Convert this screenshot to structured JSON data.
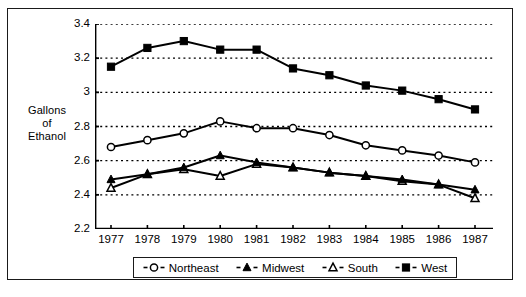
{
  "figure": {
    "background": "#ffffff",
    "border_color": "#1a1a1a"
  },
  "axis_title": {
    "line1": "Gallons",
    "line2": "of",
    "line3": "Ethanol"
  },
  "y_axis": {
    "ticks": [
      "3.4",
      "3.2",
      "3",
      "2.8",
      "2.6",
      "2.4",
      "2.2"
    ],
    "min": 2.2,
    "max": 3.4,
    "gridlines": true
  },
  "x_axis": {
    "ticks": [
      "1977",
      "1978",
      "1979",
      "1980",
      "1981",
      "1982",
      "1983",
      "1984",
      "1985",
      "1986",
      "1987"
    ]
  },
  "legend": {
    "items": [
      {
        "label": "Northeast",
        "marker": "open-circle-icon"
      },
      {
        "label": "Midwest",
        "marker": "filled-triangle-icon"
      },
      {
        "label": "South",
        "marker": "open-triangle-icon"
      },
      {
        "label": "West",
        "marker": "filled-square-icon"
      }
    ]
  },
  "chart_data": {
    "type": "line",
    "title": "",
    "xlabel": "",
    "ylabel": "Gallons of Ethanol",
    "x": [
      "1977",
      "1978",
      "1979",
      "1980",
      "1981",
      "1982",
      "1983",
      "1984",
      "1985",
      "1986",
      "1987"
    ],
    "ylim": [
      2.2,
      3.4
    ],
    "yticks": [
      2.2,
      2.4,
      2.6,
      2.8,
      3.0,
      3.2,
      3.4
    ],
    "grid": "horizontal-dotted",
    "legend_position": "bottom",
    "series": [
      {
        "name": "Northeast",
        "marker": "open-circle",
        "color": "#000000",
        "values": [
          2.68,
          2.72,
          2.76,
          2.83,
          2.79,
          2.79,
          2.75,
          2.69,
          2.66,
          2.63,
          2.59
        ]
      },
      {
        "name": "Midwest",
        "marker": "filled-triangle",
        "color": "#000000",
        "values": [
          2.49,
          2.52,
          2.56,
          2.63,
          2.59,
          2.56,
          2.53,
          2.51,
          2.49,
          2.46,
          2.43
        ]
      },
      {
        "name": "South",
        "marker": "open-triangle",
        "color": "#000000",
        "values": [
          2.44,
          2.52,
          2.55,
          2.51,
          2.58,
          2.56,
          2.53,
          2.51,
          2.48,
          2.46,
          2.38
        ]
      },
      {
        "name": "West",
        "marker": "filled-square",
        "color": "#000000",
        "values": [
          3.15,
          3.26,
          3.3,
          3.25,
          3.25,
          3.14,
          3.1,
          3.04,
          3.01,
          2.96,
          2.9
        ]
      }
    ]
  }
}
